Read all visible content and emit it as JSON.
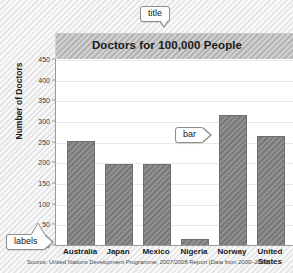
{
  "chart_data": {
    "type": "bar",
    "title": "Doctors for 100,000 People",
    "xlabel": "",
    "ylabel": "Number of Doctors",
    "categories": [
      "Australia",
      "Japan",
      "Mexico",
      "Nigeria",
      "Norway",
      "United States"
    ],
    "values": [
      255,
      198,
      198,
      18,
      316,
      267
    ],
    "ylim": [
      0,
      450
    ],
    "ytick_step": 50,
    "yticks": [
      0,
      50,
      100,
      150,
      200,
      250,
      300,
      350,
      400,
      450
    ],
    "grid": true,
    "legend": false,
    "bar_color": "#7f7f7f",
    "plot_background": "#ffffff",
    "title_band_color": "#bdbdbd",
    "source": "Source: United Nations Development Programme, 2007/2008 Report (Data from 2000–2004)"
  },
  "annotations": {
    "title_callout": "title",
    "bar_callout": "bar",
    "labels_callout": "labels"
  }
}
